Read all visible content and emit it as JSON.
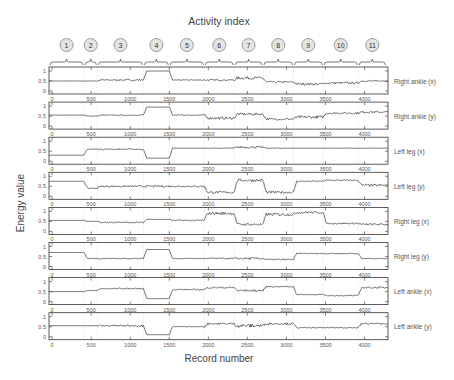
{
  "chart_data": {
    "type": "line",
    "title": "Activity index",
    "xlabel": "Record number",
    "ylabel": "Energy value",
    "xlim": [
      -40,
      4300
    ],
    "ylim": [
      -0.15,
      1.2
    ],
    "xticks": [
      0,
      500,
      1000,
      1500,
      2000,
      2500,
      3000,
      3500,
      4000
    ],
    "yticks": [
      0,
      0.5,
      1
    ],
    "ytick_labels": [
      "0",
      "0.5",
      "1"
    ],
    "grid": "vertical dotted at activity boundaries",
    "activities": [
      {
        "label": "1",
        "start": -40,
        "end": 410
      },
      {
        "label": "2",
        "start": 410,
        "end": 580
      },
      {
        "label": "3",
        "start": 580,
        "end": 1170
      },
      {
        "label": "4",
        "start": 1170,
        "end": 1500
      },
      {
        "label": "5",
        "start": 1500,
        "end": 1950
      },
      {
        "label": "6",
        "start": 1950,
        "end": 2330
      },
      {
        "label": "7",
        "start": 2330,
        "end": 2700
      },
      {
        "label": "8",
        "start": 2700,
        "end": 3090
      },
      {
        "label": "9",
        "start": 3090,
        "end": 3470
      },
      {
        "label": "10",
        "start": 3470,
        "end": 3920
      },
      {
        "label": "11",
        "start": 3920,
        "end": 4280
      }
    ],
    "series": [
      {
        "name": "Right ankle (x)",
        "levels": [
          0.5,
          0.5,
          0.55,
          1.0,
          0.55,
          0.55,
          0.65,
          0.45,
          0.35,
          0.4,
          0.5
        ],
        "noise": [
          0.0,
          0.0,
          0.04,
          0.0,
          0.02,
          0.04,
          0.07,
          0.04,
          0.06,
          0.05,
          0.03
        ]
      },
      {
        "name": "Right ankle (y)",
        "levels": [
          0.55,
          0.5,
          0.55,
          0.95,
          0.55,
          0.4,
          0.6,
          0.35,
          0.45,
          0.65,
          0.7
        ],
        "noise": [
          0.0,
          0.01,
          0.03,
          0.0,
          0.03,
          0.06,
          0.06,
          0.05,
          0.07,
          0.05,
          0.05
        ]
      },
      {
        "name": "Left leg (x)",
        "levels": [
          0.3,
          0.6,
          0.6,
          0.15,
          0.65,
          0.65,
          0.7,
          0.65,
          0.65,
          0.65,
          0.65
        ],
        "noise": [
          0.0,
          0.02,
          0.03,
          0.0,
          0.01,
          0.02,
          0.05,
          0.02,
          0.01,
          0.01,
          0.01
        ]
      },
      {
        "name": "Left leg (y)",
        "levels": [
          0.75,
          0.4,
          0.5,
          0.5,
          0.5,
          0.2,
          0.8,
          0.2,
          0.75,
          0.8,
          0.55
        ],
        "noise": [
          0.0,
          0.03,
          0.04,
          0.05,
          0.04,
          0.06,
          0.07,
          0.06,
          0.04,
          0.03,
          0.06
        ]
      },
      {
        "name": "Right leg (x)",
        "levels": [
          0.55,
          0.5,
          0.45,
          0.6,
          0.55,
          0.9,
          0.35,
          0.85,
          0.95,
          0.4,
          0.35
        ],
        "noise": [
          0.0,
          0.01,
          0.03,
          0.0,
          0.03,
          0.07,
          0.06,
          0.07,
          0.06,
          0.04,
          0.05
        ]
      },
      {
        "name": "Right leg (y)",
        "levels": [
          0.7,
          0.4,
          0.4,
          0.85,
          0.4,
          0.4,
          0.4,
          0.35,
          0.65,
          0.65,
          0.4
        ],
        "noise": [
          0.0,
          0.02,
          0.03,
          0.0,
          0.02,
          0.03,
          0.05,
          0.03,
          0.03,
          0.03,
          0.02
        ]
      },
      {
        "name": "Left ankle (x)",
        "levels": [
          0.5,
          0.55,
          0.65,
          0.15,
          0.6,
          0.7,
          0.55,
          0.75,
          0.35,
          0.3,
          0.7
        ],
        "noise": [
          0.0,
          0.02,
          0.03,
          0.0,
          0.03,
          0.04,
          0.05,
          0.03,
          0.02,
          0.02,
          0.04
        ]
      },
      {
        "name": "Left ankle (y)",
        "levels": [
          0.55,
          0.55,
          0.55,
          0.1,
          0.5,
          0.65,
          0.55,
          0.65,
          0.45,
          0.45,
          0.65
        ],
        "noise": [
          0.0,
          0.01,
          0.05,
          0.0,
          0.02,
          0.05,
          0.09,
          0.05,
          0.02,
          0.02,
          0.04
        ]
      }
    ]
  },
  "labels": {
    "title": "Activity index",
    "xlabel": "Record number",
    "ylabel": "Energy value"
  }
}
